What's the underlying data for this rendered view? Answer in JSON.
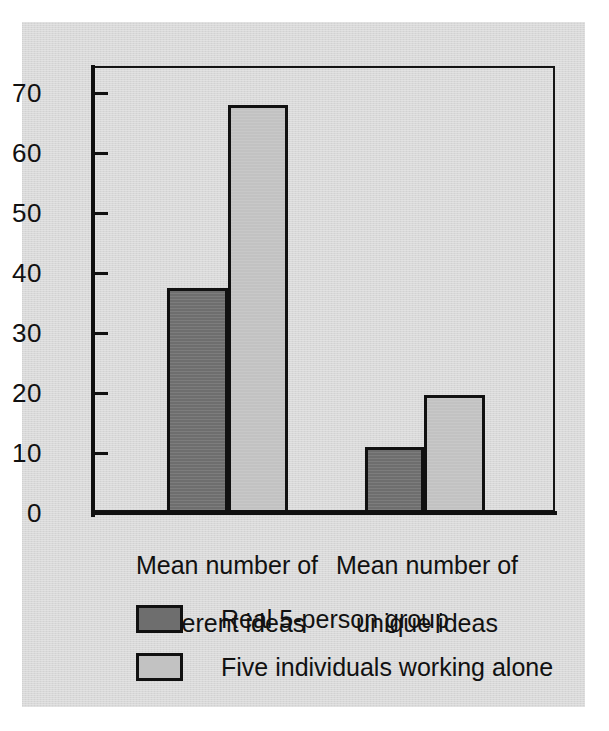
{
  "chart_data": {
    "type": "bar",
    "title": "",
    "subtitle": "",
    "xlabel": "",
    "ylabel": "",
    "categories": [
      "Mean number of\ndifferent ideas",
      "Mean number of\nunique ideas"
    ],
    "series": [
      {
        "name": "Real 5-person group",
        "values": [
          37.5,
          11
        ],
        "color": "#6e6e6e"
      },
      {
        "name": "Five individuals working alone",
        "values": [
          68,
          19.7
        ],
        "color": "#c2c2c2"
      }
    ],
    "ylim": [
      0,
      74.5
    ],
    "yticks": [
      0,
      10,
      20,
      30,
      40,
      50,
      60,
      70
    ],
    "ytick_labels": [
      "0",
      "10",
      "20",
      "30",
      "40",
      "50",
      "60",
      "70"
    ],
    "grid": false,
    "legend_position": "bottom-left",
    "frame": "box",
    "background_color": "#d9d9d9",
    "axis_color": "#111111"
  },
  "axis": {
    "labels": [
      "70",
      "60",
      "50",
      "40",
      "30",
      "20",
      "10",
      "0"
    ]
  },
  "categories": [
    {
      "line1": "Mean number of",
      "line2": "different ideas"
    },
    {
      "line1": "Mean number of",
      "line2": "unique ideas"
    }
  ],
  "legend": {
    "items": [
      {
        "label": "Real 5-person group",
        "swatch": "dark-swatch-icon"
      },
      {
        "label": "Five individuals working alone",
        "swatch": "light-swatch-icon"
      }
    ]
  }
}
